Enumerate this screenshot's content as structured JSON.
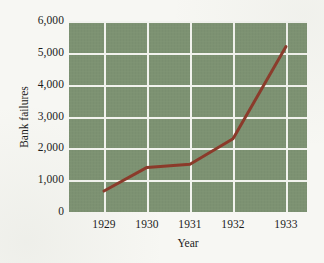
{
  "chart_data": {
    "type": "line",
    "title": "",
    "xlabel": "Year",
    "ylabel": "Bank failures",
    "categories": [
      "1929",
      "1930",
      "1931",
      "1932",
      "1933"
    ],
    "x": [
      1929,
      1930,
      1931,
      1932,
      1933
    ],
    "values": [
      660,
      1400,
      1500,
      2300,
      5200
    ],
    "series": [
      {
        "name": "Bank failures",
        "values": [
          660,
          1400,
          1500,
          2300,
          5200
        ]
      }
    ],
    "ylim": [
      0,
      6000
    ],
    "yticks": [
      0,
      1000,
      2000,
      3000,
      4000,
      5000,
      6000
    ],
    "ytick_labels": [
      "0",
      "1,000",
      "2,000",
      "3,000",
      "4,000",
      "5,000",
      "6,000"
    ],
    "xtick_labels": [
      "1929",
      "1930",
      "1931",
      "1932",
      "1933"
    ],
    "grid": true,
    "legend": false,
    "legend_position": "none",
    "markers": false,
    "colors": {
      "line": "#8b3a2a",
      "plot_background": "#7d9272",
      "gridline": "#f2f3ee",
      "page_background": "#f7f7f3",
      "text": "#1b1b1b"
    },
    "line_width": 3
  }
}
